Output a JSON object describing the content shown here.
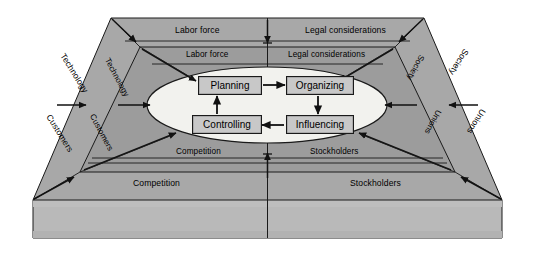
{
  "figure": {
    "type": "3d-trapezoid-layers"
  },
  "colors": {
    "outer_band": "#a8a8a8",
    "inner_band": "#9c9c9c",
    "base_top": "#b4b4b4",
    "base_front": "#b9b9b9",
    "ellipse_fill": "#f2f2ee",
    "box_fill": "#c8c8c8",
    "stroke": "#1a1a1a",
    "background": "#ffffff"
  },
  "center": {
    "ellipse_name": "management-functions-ellipse",
    "functions": [
      {
        "id": "planning",
        "label": "Planning"
      },
      {
        "id": "organizing",
        "label": "Organizing"
      },
      {
        "id": "influencing",
        "label": "Influencing"
      },
      {
        "id": "controlling",
        "label": "Controlling"
      }
    ],
    "cycle_order": [
      "Planning",
      "Organizing",
      "Influencing",
      "Controlling"
    ]
  },
  "environment": {
    "outer_ring": [
      {
        "id": "labor-force-outer",
        "label": "Labor force",
        "side": "top-left"
      },
      {
        "id": "legal-considerations-outer",
        "label": "Legal considerations",
        "side": "top-right"
      },
      {
        "id": "technology-outer",
        "label": "Technology",
        "side": "left-upper"
      },
      {
        "id": "customers-outer",
        "label": "Customers",
        "side": "left-lower"
      },
      {
        "id": "society-outer",
        "label": "Society",
        "side": "right-upper"
      },
      {
        "id": "unions-outer",
        "label": "Unions",
        "side": "right-lower"
      },
      {
        "id": "competition-outer",
        "label": "Competition",
        "side": "bottom-left"
      },
      {
        "id": "stockholders-outer",
        "label": "Stockholders",
        "side": "bottom-right"
      }
    ],
    "inner_ring": [
      {
        "id": "labor-force-inner",
        "label": "Labor force",
        "side": "top-left"
      },
      {
        "id": "legal-considerations-inner",
        "label": "Legal considerations",
        "side": "top-right"
      },
      {
        "id": "technology-inner",
        "label": "Technology",
        "side": "left-upper"
      },
      {
        "id": "customers-inner",
        "label": "Customers",
        "side": "left-lower"
      },
      {
        "id": "society-inner",
        "label": "Society",
        "side": "right-upper"
      },
      {
        "id": "unions-inner",
        "label": "Unions",
        "side": "right-lower"
      },
      {
        "id": "competition-inner",
        "label": "Competition",
        "side": "bottom-left"
      },
      {
        "id": "stockholders-inner",
        "label": "Stockholders",
        "side": "bottom-right"
      }
    ]
  }
}
